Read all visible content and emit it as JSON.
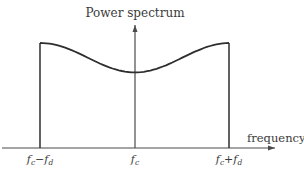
{
  "diagram": {
    "y_axis_label": "Power spectrum",
    "x_axis_label": "frequency",
    "ticks": [
      {
        "name": "tick-fc-minus-fd",
        "base": "f",
        "sub": "c",
        "op": "−",
        "base2": "f",
        "sub2": "d"
      },
      {
        "name": "tick-fc",
        "base": "f",
        "sub": "c"
      },
      {
        "name": "tick-fc-plus-fd",
        "base": "f",
        "sub": "c",
        "op": "+",
        "base2": "f",
        "sub2": "d"
      }
    ],
    "spectrum": {
      "description": "Band-limited power spectrum between fc-fd and fc+fd, peaking at the band edges with a minimum at fc",
      "edge_level": 1.0,
      "center_level": 0.72
    }
  }
}
